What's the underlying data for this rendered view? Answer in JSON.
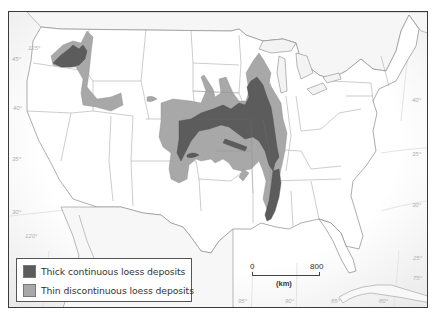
{
  "map": {
    "subject": "Loess deposits in the conterminous United States",
    "colors": {
      "ocean": "#f3f3f3",
      "land": "#ffffff",
      "border": "#8a8a8a",
      "thick": "#5c5c5c",
      "thin": "#a8a8a8",
      "frame": "#3a3a3a"
    },
    "graticule": {
      "latitudes": [
        "45°",
        "40°",
        "35°",
        "30°",
        "25°"
      ],
      "longitudes": [
        "125°",
        "120°",
        "95°",
        "90°",
        "85°",
        "80°",
        "75°"
      ],
      "labels": [
        {
          "text": "125°",
          "x": 27,
          "y": 44
        },
        {
          "text": "45°",
          "x": 11,
          "y": 55
        },
        {
          "text": "40°",
          "x": 12,
          "y": 104
        },
        {
          "text": "35°",
          "x": 11,
          "y": 155
        },
        {
          "text": "30°",
          "x": 11,
          "y": 208
        },
        {
          "text": "120°",
          "x": 24,
          "y": 232
        },
        {
          "text": "40°",
          "x": 418,
          "y": 96
        },
        {
          "text": "35°",
          "x": 418,
          "y": 150
        },
        {
          "text": "30°",
          "x": 418,
          "y": 201
        },
        {
          "text": "25°",
          "x": 419,
          "y": 254
        },
        {
          "text": "75°",
          "x": 419,
          "y": 274
        },
        {
          "text": "95°",
          "x": 237,
          "y": 297
        },
        {
          "text": "90°",
          "x": 284,
          "y": 297
        },
        {
          "text": "85°",
          "x": 330,
          "y": 297
        },
        {
          "text": "80°",
          "x": 378,
          "y": 297
        }
      ]
    }
  },
  "legend": {
    "items": [
      {
        "label": "Thick continuous loess deposits",
        "color": "#5c5c5c"
      },
      {
        "label": "Thin discontinuous loess deposits",
        "color": "#a8a8a8"
      }
    ]
  },
  "scale_bar": {
    "start": "0",
    "end": "800",
    "unit": "(km)"
  }
}
